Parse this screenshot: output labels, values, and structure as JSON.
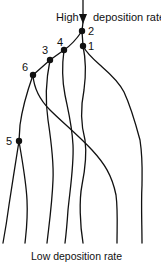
{
  "diagram": {
    "top_label_left": "High",
    "top_label_right": "deposition rate",
    "bottom_label": "Low deposition rate",
    "nodes": [
      {
        "id": "1",
        "label": "1"
      },
      {
        "id": "2",
        "label": "2"
      },
      {
        "id": "3",
        "label": "3"
      },
      {
        "id": "4",
        "label": "4"
      },
      {
        "id": "5",
        "label": "5"
      },
      {
        "id": "6",
        "label": "6"
      }
    ],
    "arrow": {
      "direction": "down",
      "meaning": "deposition rate decreases downward"
    }
  }
}
